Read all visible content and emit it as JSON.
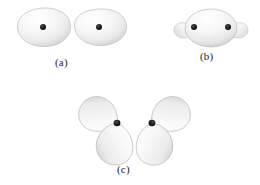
{
  "figure": {
    "kind": "orbital-diagram",
    "background_color": "#ffffff",
    "lobe_fill_light": "#fdfdfd",
    "lobe_fill_mid": "#e9e9e9",
    "lobe_fill_dark": "#c9c9c9",
    "lobe_edge_color": "#b4b4b4",
    "nucleus_color": "#1a1a1a",
    "width": 260,
    "height": 185,
    "panels": [
      {
        "id": "a",
        "label": "(a)",
        "description": "two separate rounded orbital lobes, each containing one nucleus dot",
        "orbitals": [
          {
            "name": "left-orbital",
            "shape": "oval-blob",
            "center_x": 44,
            "center_y": 27,
            "radius_x": 26,
            "radius_y": 19,
            "nucleus": {
              "x": 43,
              "y": 27,
              "r": 3
            }
          },
          {
            "name": "right-orbital",
            "shape": "oval-blob",
            "center_x": 100,
            "center_y": 27,
            "radius_x": 26,
            "radius_y": 18,
            "nucleus": {
              "x": 99,
              "y": 27,
              "r": 3
            }
          }
        ]
      },
      {
        "id": "b",
        "label": "(b)",
        "description": "the two orbitals overlapped into one large sigma lobe with two nuclei and small back lobes on each side",
        "orbitals": [
          {
            "name": "bonding-lobe",
            "shape": "large-ellipse",
            "center_x": 211,
            "center_y": 28,
            "radius_x": 26,
            "radius_y": 19,
            "nuclei": [
              {
                "x": 194,
                "y": 27,
                "r": 3
              },
              {
                "x": 228,
                "y": 27,
                "r": 3
              }
            ]
          },
          {
            "name": "left-back-lobe",
            "shape": "small-teardrop",
            "tip_x": 194,
            "tip_y": 27,
            "extent": 20,
            "direction": "left"
          },
          {
            "name": "right-back-lobe",
            "shape": "small-teardrop",
            "tip_x": 228,
            "tip_y": 27,
            "extent": 20,
            "direction": "right"
          }
        ]
      },
      {
        "id": "c",
        "label": "(c)",
        "description": "two p-type orbitals side by side, each a pair of teardrop lobes meeting at a nucleus, tilted away from each other",
        "orbitals": [
          {
            "name": "left-p-orbital",
            "nucleus": {
              "x": 117,
              "y": 123,
              "r": 3.4
            },
            "lobes": [
              {
                "name": "upper-left-lobe",
                "rotation_deg": -152,
                "length": 40,
                "width": 23
              },
              {
                "name": "lower-left-lobe",
                "rotation_deg": 152,
                "length": 42,
                "width": 24
              }
            ]
          },
          {
            "name": "right-p-orbital",
            "nucleus": {
              "x": 152,
              "y": 123,
              "r": 3.4
            },
            "lobes": [
              {
                "name": "upper-right-lobe",
                "rotation_deg": 152,
                "length": 40,
                "width": 23
              },
              {
                "name": "lower-right-lobe",
                "rotation_deg": -152,
                "length": 42,
                "width": 24
              }
            ]
          }
        ]
      }
    ]
  }
}
